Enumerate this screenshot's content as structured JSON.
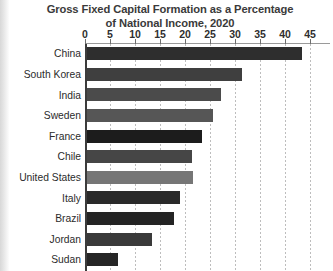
{
  "chart_data": {
    "type": "bar",
    "orientation": "horizontal",
    "title": "Gross Fixed Capital Formation as a Percentage of National Income, 2020",
    "title_line1": "Gross Fixed Capital Formation as a Percentage",
    "title_line2": "of National Income, 2020",
    "xlabel": "",
    "ylabel": "",
    "xlim": [
      0,
      45
    ],
    "grid": "vertical-dotted",
    "legend": "none",
    "xticks": [
      0,
      5,
      10,
      15,
      20,
      25,
      30,
      35,
      40,
      45
    ],
    "xtick_labels": [
      "0",
      "5",
      "10",
      "15",
      "20",
      "25",
      "30",
      "35",
      "40",
      "45"
    ],
    "categories": [
      "China",
      "South Korea",
      "India",
      "Sweden",
      "France",
      "Chile",
      "United States",
      "Italy",
      "Brazil",
      "Jordan",
      "Sudan"
    ],
    "values": [
      43,
      31,
      26.8,
      25.2,
      23,
      21,
      21.2,
      18.6,
      17.4,
      13,
      6.2
    ],
    "bar_colors": [
      "#2e2e2e",
      "#3f3f3f",
      "#4b4b4b",
      "#565656",
      "#1c1c1c",
      "#464646",
      "#767676",
      "#2a2a2a",
      "#242424",
      "#3a3a3a",
      "#262626"
    ]
  }
}
